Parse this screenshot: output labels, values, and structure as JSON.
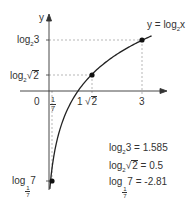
{
  "chart_data": {
    "type": "line",
    "title": "",
    "function_label": "y = log2x",
    "function_label_parts": {
      "prefix": "y = log",
      "sub": "2",
      "suffix": "x"
    },
    "xlabel": "",
    "ylabel": "y",
    "origin_label": "0",
    "x_ticks": [
      {
        "value": 0.142857,
        "label": "1/7",
        "num": "1",
        "den": "7"
      },
      {
        "value": 1,
        "label": "1"
      },
      {
        "value": 1.41421,
        "label": "√2",
        "radicand": "2"
      },
      {
        "value": 3,
        "label": "3"
      }
    ],
    "y_ticks": [
      {
        "value": 1.585,
        "label": "log2 3",
        "base": "2",
        "arg": "3"
      },
      {
        "value": 0.5,
        "label": "log2√2",
        "base": "2",
        "arg_radicand": "2"
      },
      {
        "value": -2.81,
        "label": "log1/7 7",
        "base_num": "1",
        "base_den": "7",
        "arg": "7"
      }
    ],
    "highlighted_points": [
      {
        "x": 3,
        "y": 1.585
      },
      {
        "x": 1.41421,
        "y": 0.5
      },
      {
        "x": 0.142857,
        "y": -2.81
      }
    ],
    "series": [
      {
        "name": "y = log2 x",
        "x": [
          0.12,
          0.142857,
          0.2,
          0.3,
          0.5,
          0.75,
          1,
          1.25,
          1.41421,
          1.75,
          2,
          2.5,
          3,
          3.3
        ],
        "values": [
          -3.06,
          -2.81,
          -2.32,
          -1.74,
          -1.0,
          -0.415,
          0,
          0.322,
          0.5,
          0.807,
          1.0,
          1.322,
          1.585,
          1.722
        ]
      }
    ],
    "annotations": [
      {
        "text": "log2 3 = 1.585",
        "base": "2",
        "arg": "3",
        "value": "= 1.585"
      },
      {
        "text": "log2√2 = 0.5",
        "base": "2",
        "arg_radicand": "2",
        "value": "= 0.5"
      },
      {
        "text": "log1/7 7 = -2.81",
        "base_num": "1",
        "base_den": "7",
        "arg": "7",
        "value": "= -2.81"
      }
    ],
    "grid": false,
    "guide_lines": "dashed",
    "xlim": [
      -0.8,
      3.8
    ],
    "ylim": [
      -3.3,
      2.4
    ]
  },
  "labels": {
    "log_word": "log",
    "y_axis": "y",
    "origin": "0",
    "x_one": "1",
    "x_three": "3",
    "sqrt_sign": "√",
    "two": "2",
    "three": "3",
    "seven": "7",
    "one": "1",
    "fn_prefix": "y = log",
    "fn_sub": "2",
    "fn_suffix": "x",
    "ann1_value": "= 1.585",
    "ann2_value": "= 0.5",
    "ann3_value": "= -2.81"
  }
}
